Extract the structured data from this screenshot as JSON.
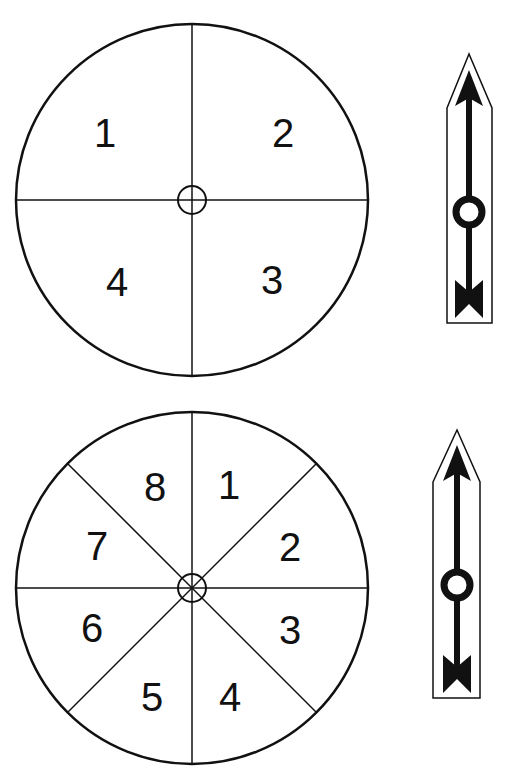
{
  "spinners": [
    {
      "name": "four-section-spinner",
      "sections": 4,
      "labels": [
        "1",
        "2",
        "3",
        "4"
      ],
      "label_positions": [
        [
          105,
          133
        ],
        [
          283,
          133
        ],
        [
          272,
          280
        ],
        [
          117,
          282
        ]
      ]
    },
    {
      "name": "eight-section-spinner",
      "sections": 8,
      "labels": [
        "1",
        "2",
        "3",
        "4",
        "5",
        "6",
        "7",
        "8"
      ],
      "label_positions": [
        [
          229,
          485
        ],
        [
          290,
          547
        ],
        [
          290,
          630
        ],
        [
          230,
          697
        ],
        [
          152,
          697
        ],
        [
          92,
          628
        ],
        [
          97,
          546
        ],
        [
          155,
          487
        ]
      ]
    }
  ],
  "colors": {
    "stroke": "#111111",
    "background": "#ffffff"
  }
}
